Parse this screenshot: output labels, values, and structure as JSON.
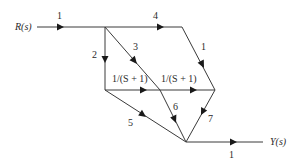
{
  "diagram": {
    "type": "signal-flow-graph",
    "input_label": "R(s)",
    "output_label": "Y(s)",
    "nodes": [
      {
        "id": "R",
        "x": 37,
        "y": 27
      },
      {
        "id": "A",
        "x": 105,
        "y": 27
      },
      {
        "id": "B",
        "x": 182,
        "y": 27
      },
      {
        "id": "C",
        "x": 105,
        "y": 90
      },
      {
        "id": "D",
        "x": 160,
        "y": 90
      },
      {
        "id": "E",
        "x": 215,
        "y": 90
      },
      {
        "id": "F",
        "x": 186,
        "y": 142
      },
      {
        "id": "Y",
        "x": 263,
        "y": 142
      }
    ],
    "edges": [
      {
        "from": "R",
        "to": "A",
        "gain": "1"
      },
      {
        "from": "A",
        "to": "B",
        "gain": "4"
      },
      {
        "from": "A",
        "to": "C",
        "gain": "2"
      },
      {
        "from": "A",
        "to": "D",
        "gain": "3"
      },
      {
        "from": "B",
        "to": "E",
        "gain": "1"
      },
      {
        "from": "C",
        "to": "D",
        "gain": "1/(S + 1)"
      },
      {
        "from": "D",
        "to": "E",
        "gain": "1/(S + 1)"
      },
      {
        "from": "C",
        "to": "F",
        "gain": "5"
      },
      {
        "from": "D",
        "to": "F",
        "gain": "6"
      },
      {
        "from": "E",
        "to": "F",
        "gain": "7"
      },
      {
        "from": "F",
        "to": "Y",
        "gain": "1"
      }
    ]
  }
}
